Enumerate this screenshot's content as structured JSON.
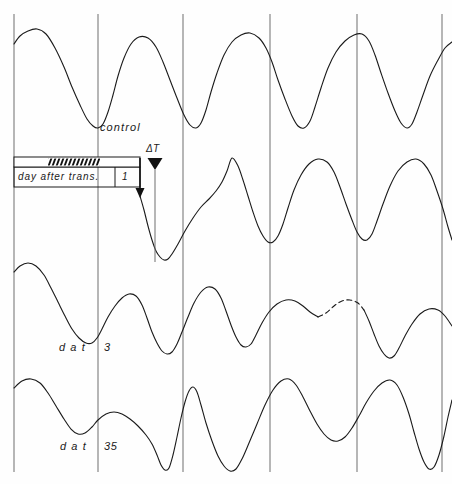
{
  "figure": {
    "title": "",
    "background_color": "#fefefe",
    "trace_color": "#1a1a1a",
    "gridline_color": "#6e6e6e",
    "width": 452,
    "height": 484
  },
  "labels": {
    "control": "control",
    "delta_t": "ΔT",
    "day_after_trans": "day after  trans.",
    "day_after_trans_value": "1",
    "dat_3_prefix": "d a t",
    "dat_3_value": "3",
    "dat_35_prefix": "d a t",
    "dat_35_value": "35"
  },
  "legend_bar": {
    "name": "light-dark-bar",
    "x": 14,
    "y": 157,
    "width": 126,
    "height": 9,
    "hatch_start": 48,
    "hatch_end": 100,
    "hatch_label": "dark-phase-hatching"
  },
  "markers": {
    "delta_t_marker": {
      "name": "delta-t-marker",
      "x": 155,
      "triangle_y": 160,
      "line_top": 168,
      "line_bottom": 262
    },
    "transfer_arrow": {
      "name": "transfer-arrow",
      "x": 140,
      "top": 158,
      "bottom": 196
    }
  },
  "gridlines": {
    "x_positions": [
      14,
      98,
      183,
      270,
      357,
      442
    ],
    "y_top": 14,
    "y_bottom": 472
  },
  "chart_data": {
    "type": "line",
    "title": "",
    "xlabel": "",
    "ylabel": "",
    "grid": true,
    "legend_position": "inline",
    "axis_ranges": {
      "x": [
        0,
        452
      ],
      "y": [
        14,
        472
      ]
    },
    "series": [
      {
        "name": "control",
        "label": "control",
        "baseline_y": 78,
        "amplitude": 50,
        "dashed_segments": [],
        "points": [
          [
            14,
            44
          ],
          [
            20,
            36
          ],
          [
            28,
            31
          ],
          [
            37,
            29
          ],
          [
            46,
            34
          ],
          [
            55,
            48
          ],
          [
            64,
            67
          ],
          [
            72,
            87
          ],
          [
            80,
            105
          ],
          [
            87,
            119
          ],
          [
            93,
            126
          ],
          [
            98,
            128
          ],
          [
            103,
            124
          ],
          [
            108,
            112
          ],
          [
            113,
            95
          ],
          [
            118,
            76
          ],
          [
            124,
            58
          ],
          [
            131,
            44
          ],
          [
            139,
            37
          ],
          [
            148,
            38
          ],
          [
            156,
            47
          ],
          [
            163,
            62
          ],
          [
            170,
            80
          ],
          [
            177,
            98
          ],
          [
            184,
            115
          ],
          [
            190,
            125
          ],
          [
            196,
            128
          ],
          [
            201,
            123
          ],
          [
            206,
            110
          ],
          [
            211,
            92
          ],
          [
            217,
            73
          ],
          [
            224,
            55
          ],
          [
            232,
            42
          ],
          [
            241,
            35
          ],
          [
            250,
            33
          ],
          [
            259,
            38
          ],
          [
            266,
            48
          ],
          [
            272,
            62
          ],
          [
            278,
            80
          ],
          [
            285,
            99
          ],
          [
            292,
            116
          ],
          [
            298,
            126
          ],
          [
            304,
            128
          ],
          [
            310,
            121
          ],
          [
            315,
            107
          ],
          [
            321,
            88
          ],
          [
            328,
            68
          ],
          [
            336,
            52
          ],
          [
            345,
            41
          ],
          [
            354,
            35
          ],
          [
            362,
            34
          ],
          [
            369,
            41
          ],
          [
            375,
            55
          ],
          [
            381,
            73
          ],
          [
            388,
            93
          ],
          [
            395,
            111
          ],
          [
            401,
            123
          ],
          [
            407,
            128
          ],
          [
            412,
            124
          ],
          [
            417,
            112
          ],
          [
            423,
            95
          ],
          [
            430,
            76
          ],
          [
            438,
            60
          ],
          [
            445,
            48
          ],
          [
            452,
            42
          ]
        ]
      },
      {
        "name": "dat_1",
        "label": "day after trans. 1",
        "baseline_y": 210,
        "amplitude": 52,
        "dashed_segments": [],
        "points": [
          [
            140,
            196
          ],
          [
            144,
            210
          ],
          [
            148,
            226
          ],
          [
            152,
            240
          ],
          [
            156,
            251
          ],
          [
            160,
            257
          ],
          [
            164,
            260
          ],
          [
            168,
            259
          ],
          [
            172,
            254
          ],
          [
            178,
            244
          ],
          [
            185,
            231
          ],
          [
            193,
            218
          ],
          [
            201,
            207
          ],
          [
            209,
            199
          ],
          [
            216,
            191
          ],
          [
            222,
            182
          ],
          [
            227,
            171
          ],
          [
            232,
            158
          ],
          [
            238,
            166
          ],
          [
            243,
            180
          ],
          [
            248,
            196
          ],
          [
            253,
            212
          ],
          [
            258,
            226
          ],
          [
            263,
            236
          ],
          [
            268,
            242
          ],
          [
            273,
            242
          ],
          [
            278,
            236
          ],
          [
            283,
            224
          ],
          [
            288,
            208
          ],
          [
            294,
            190
          ],
          [
            301,
            175
          ],
          [
            309,
            164
          ],
          [
            318,
            159
          ],
          [
            327,
            162
          ],
          [
            334,
            172
          ],
          [
            340,
            187
          ],
          [
            346,
            204
          ],
          [
            352,
            220
          ],
          [
            357,
            232
          ],
          [
            362,
            239
          ],
          [
            367,
            240
          ],
          [
            372,
            234
          ],
          [
            377,
            221
          ],
          [
            383,
            204
          ],
          [
            390,
            186
          ],
          [
            398,
            171
          ],
          [
            407,
            162
          ],
          [
            416,
            159
          ],
          [
            424,
            164
          ],
          [
            431,
            175
          ],
          [
            437,
            191
          ],
          [
            443,
            209
          ],
          [
            448,
            227
          ],
          [
            452,
            240
          ]
        ]
      },
      {
        "name": "dat_3",
        "label": "d a t 3",
        "baseline_y": 318,
        "amplitude": 48,
        "dashed_segments": [
          [
            318,
            360
          ]
        ],
        "points": [
          [
            14,
            272
          ],
          [
            20,
            266
          ],
          [
            28,
            263
          ],
          [
            36,
            266
          ],
          [
            44,
            275
          ],
          [
            51,
            288
          ],
          [
            58,
            302
          ],
          [
            65,
            316
          ],
          [
            72,
            329
          ],
          [
            79,
            338
          ],
          [
            86,
            343
          ],
          [
            92,
            343
          ],
          [
            97,
            338
          ],
          [
            102,
            329
          ],
          [
            108,
            317
          ],
          [
            115,
            306
          ],
          [
            122,
            298
          ],
          [
            129,
            294
          ],
          [
            136,
            296
          ],
          [
            142,
            305
          ],
          [
            147,
            318
          ],
          [
            152,
            332
          ],
          [
            157,
            343
          ],
          [
            162,
            351
          ],
          [
            167,
            354
          ],
          [
            172,
            352
          ],
          [
            177,
            344
          ],
          [
            182,
            332
          ],
          [
            188,
            317
          ],
          [
            194,
            303
          ],
          [
            201,
            292
          ],
          [
            208,
            287
          ],
          [
            215,
            289
          ],
          [
            221,
            298
          ],
          [
            226,
            311
          ],
          [
            231,
            325
          ],
          [
            236,
            337
          ],
          [
            241,
            345
          ],
          [
            246,
            347
          ],
          [
            251,
            344
          ],
          [
            256,
            335
          ],
          [
            262,
            323
          ],
          [
            269,
            312
          ],
          [
            277,
            304
          ],
          [
            286,
            300
          ],
          [
            295,
            301
          ],
          [
            303,
            306
          ],
          [
            310,
            312
          ],
          [
            318,
            317
          ],
          [
            326,
            313
          ],
          [
            334,
            306
          ],
          [
            342,
            301
          ],
          [
            350,
            300
          ],
          [
            358,
            303
          ],
          [
            364,
            310
          ],
          [
            369,
            321
          ],
          [
            374,
            334
          ],
          [
            379,
            346
          ],
          [
            384,
            354
          ],
          [
            389,
            358
          ],
          [
            394,
            356
          ],
          [
            399,
            348
          ],
          [
            405,
            336
          ],
          [
            412,
            324
          ],
          [
            420,
            314
          ],
          [
            429,
            309
          ],
          [
            438,
            310
          ],
          [
            445,
            316
          ],
          [
            452,
            326
          ]
        ]
      },
      {
        "name": "dat_35",
        "label": "d a t 35",
        "baseline_y": 420,
        "amplitude": 55,
        "dashed_segments": [],
        "points": [
          [
            14,
            388
          ],
          [
            22,
            381
          ],
          [
            31,
            379
          ],
          [
            40,
            383
          ],
          [
            48,
            393
          ],
          [
            56,
            406
          ],
          [
            64,
            419
          ],
          [
            71,
            429
          ],
          [
            78,
            434
          ],
          [
            85,
            433
          ],
          [
            92,
            427
          ],
          [
            98,
            420
          ],
          [
            106,
            414
          ],
          [
            114,
            412
          ],
          [
            122,
            414
          ],
          [
            130,
            419
          ],
          [
            138,
            426
          ],
          [
            146,
            435
          ],
          [
            152,
            444
          ],
          [
            157,
            455
          ],
          [
            161,
            465
          ],
          [
            165,
            470
          ],
          [
            169,
            468
          ],
          [
            173,
            455
          ],
          [
            177,
            437
          ],
          [
            181,
            418
          ],
          [
            185,
            402
          ],
          [
            189,
            391
          ],
          [
            193,
            387
          ],
          [
            197,
            392
          ],
          [
            201,
            405
          ],
          [
            206,
            423
          ],
          [
            212,
            441
          ],
          [
            218,
            456
          ],
          [
            224,
            466
          ],
          [
            230,
            471
          ],
          [
            236,
            469
          ],
          [
            242,
            459
          ],
          [
            249,
            443
          ],
          [
            257,
            424
          ],
          [
            265,
            405
          ],
          [
            273,
            390
          ],
          [
            281,
            381
          ],
          [
            289,
            379
          ],
          [
            296,
            385
          ],
          [
            303,
            397
          ],
          [
            310,
            411
          ],
          [
            317,
            424
          ],
          [
            324,
            434
          ],
          [
            331,
            440
          ],
          [
            338,
            441
          ],
          [
            345,
            437
          ],
          [
            352,
            428
          ],
          [
            359,
            416
          ],
          [
            366,
            403
          ],
          [
            374,
            391
          ],
          [
            382,
            383
          ],
          [
            390,
            380
          ],
          [
            397,
            385
          ],
          [
            403,
            397
          ],
          [
            409,
            414
          ],
          [
            414,
            432
          ],
          [
            419,
            449
          ],
          [
            424,
            462
          ],
          [
            429,
            469
          ],
          [
            434,
            467
          ],
          [
            439,
            455
          ],
          [
            444,
            436
          ],
          [
            448,
            417
          ],
          [
            452,
            400
          ]
        ]
      }
    ]
  }
}
